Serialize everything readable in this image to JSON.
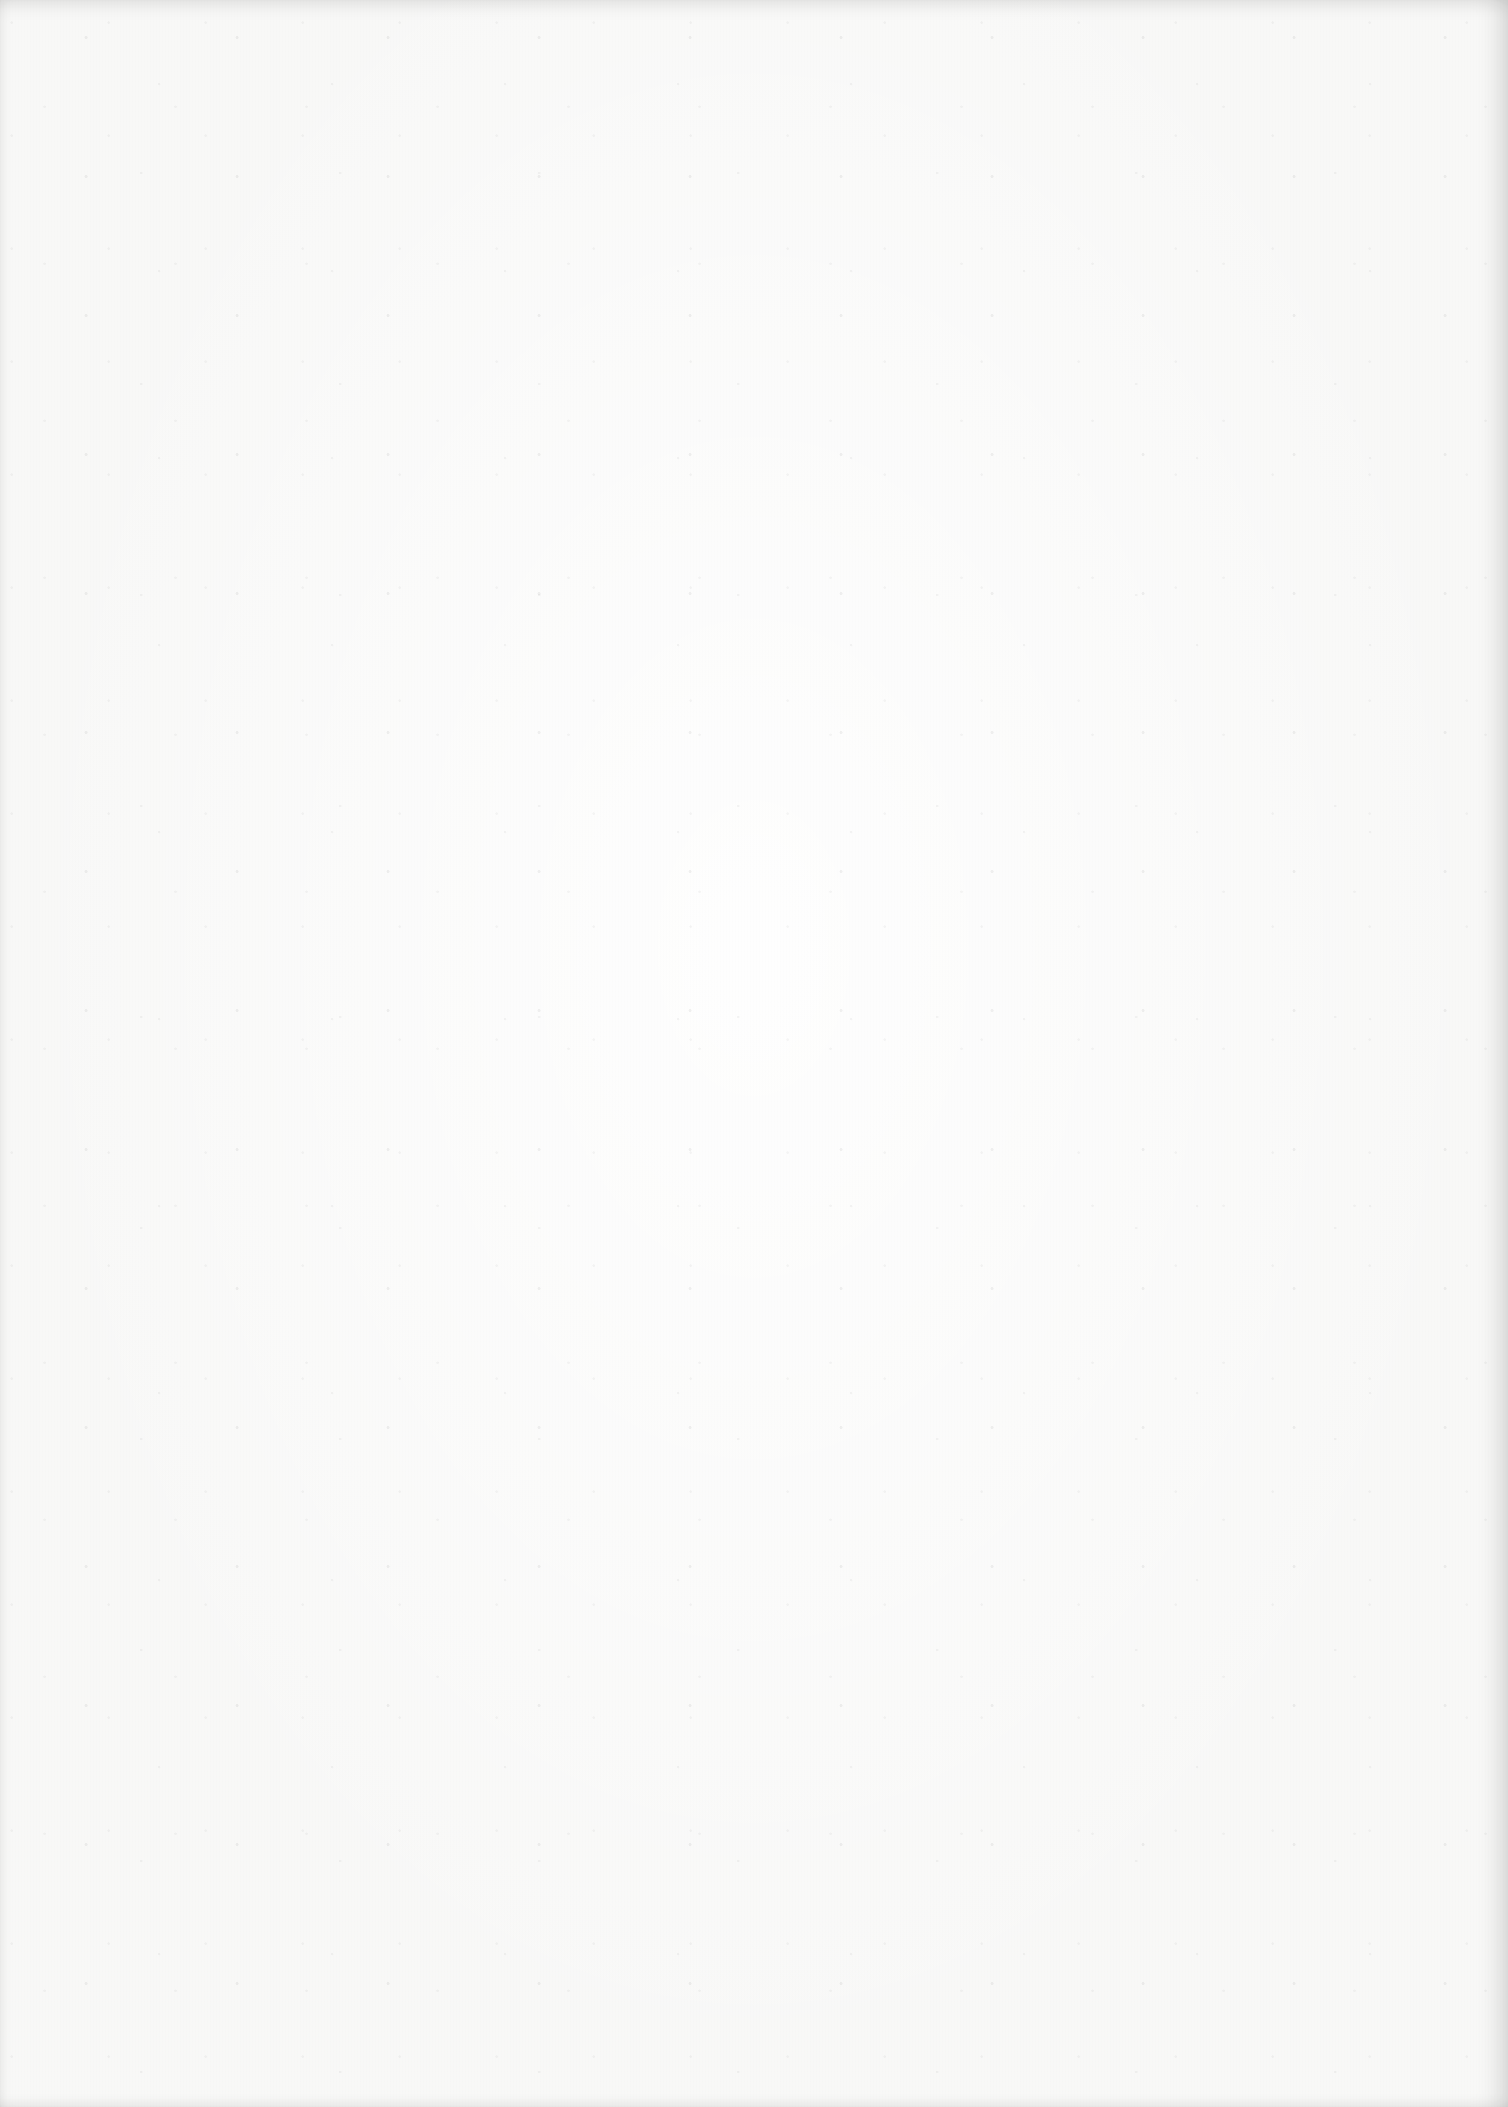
{
  "page": {
    "background_color": "#f8f8f7",
    "edge_shadow_color": "#d9d9d7",
    "content": []
  }
}
